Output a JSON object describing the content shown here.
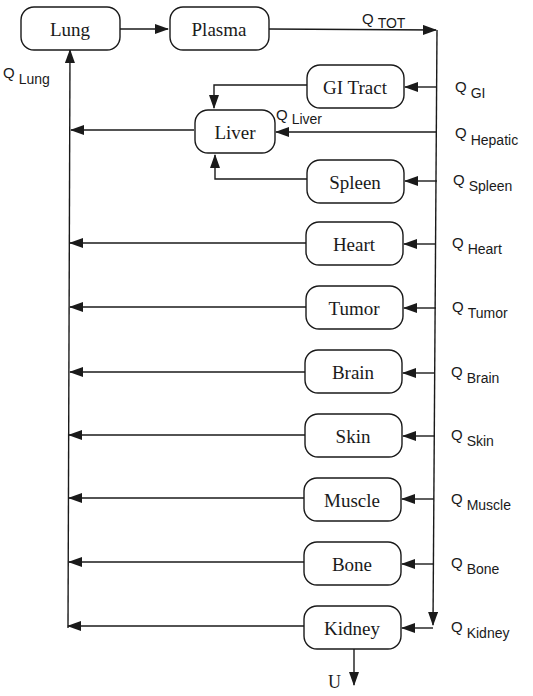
{
  "diagram": {
    "title": "",
    "nodes": [
      {
        "id": "lung",
        "label": "Lung"
      },
      {
        "id": "plasma",
        "label": "Plasma"
      },
      {
        "id": "gi",
        "label": "GI Tract"
      },
      {
        "id": "liver",
        "label": "Liver"
      },
      {
        "id": "spleen",
        "label": "Spleen"
      },
      {
        "id": "heart",
        "label": "Heart"
      },
      {
        "id": "tumor",
        "label": "Tumor"
      },
      {
        "id": "brain",
        "label": "Brain"
      },
      {
        "id": "skin",
        "label": "Skin"
      },
      {
        "id": "muscle",
        "label": "Muscle"
      },
      {
        "id": "bone",
        "label": "Bone"
      },
      {
        "id": "kidney",
        "label": "Kidney"
      }
    ],
    "flows": {
      "tot": {
        "q": "Q",
        "sub": "TOT"
      },
      "lung": {
        "q": "Q",
        "sub": "Lung"
      },
      "gi": {
        "q": "Q",
        "sub": "GI"
      },
      "liver": {
        "q": "Q",
        "sub": "Liver"
      },
      "hepatic": {
        "q": "Q",
        "sub": "Hepatic"
      },
      "spleen": {
        "q": "Q",
        "sub": "Spleen"
      },
      "heart": {
        "q": "Q",
        "sub": "Heart"
      },
      "tumor": {
        "q": "Q",
        "sub": "Tumor"
      },
      "brain": {
        "q": "Q",
        "sub": "Brain"
      },
      "skin": {
        "q": "Q",
        "sub": "Skin"
      },
      "muscle": {
        "q": "Q",
        "sub": "Muscle"
      },
      "bone": {
        "q": "Q",
        "sub": "Bone"
      },
      "kidney": {
        "q": "Q",
        "sub": "Kidney"
      }
    },
    "excretion_label": "U"
  }
}
